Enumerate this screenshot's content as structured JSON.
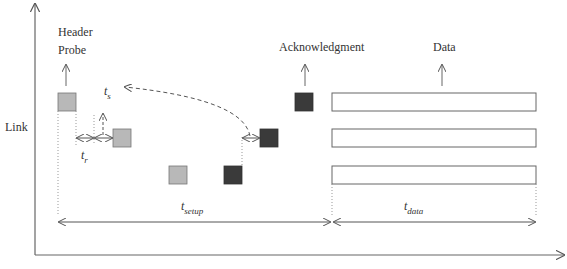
{
  "labels": {
    "y_axis": "Link",
    "header_probe_line1": "Header",
    "header_probe_line2": "Probe",
    "acknowledgment": "Acknowledgment",
    "data": "Data",
    "t_r_main": "t",
    "t_r_sub": "r",
    "t_s_main": "t",
    "t_s_sub": "s",
    "t_setup_main": "t",
    "t_setup_sub": "setup",
    "t_data_main": "t",
    "t_data_sub": "data"
  },
  "colors": {
    "axis": "#666666",
    "probe_fill": "#b8b8b8",
    "ack_fill": "#3a3a3a",
    "data_fill": "#ffffff",
    "line": "#555555"
  },
  "elements": {
    "probe_packets": 3,
    "ack_packets": 3,
    "data_blocks": 3
  }
}
